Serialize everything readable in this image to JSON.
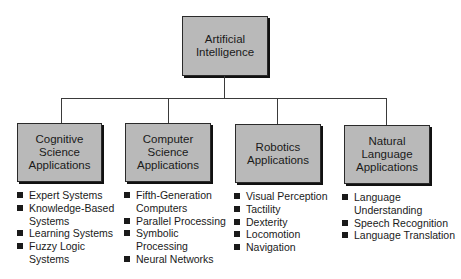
{
  "root": {
    "label": "Artificial\nIntelligence"
  },
  "children": [
    {
      "label": "Cognitive\nScience\nApplications",
      "items": [
        "Expert Systems",
        "Knowledge-Based\nSystems",
        "Learning Systems",
        "Fuzzy Logic\nSystems"
      ]
    },
    {
      "label": "Computer\nScience\nApplications",
      "items": [
        "Fifth-Generation\nComputers",
        "Parallel Processing",
        "Symbolic\nProcessing",
        "Neural Networks"
      ]
    },
    {
      "label": "Robotics\nApplications",
      "items": [
        "Visual Perception",
        "Tactility",
        "Dexterity",
        "Locomotion",
        "Navigation"
      ]
    },
    {
      "label": "Natural\nLanguage\nApplications",
      "items": [
        "Language\nUnderstanding",
        "Speech Recognition",
        "Language Translation"
      ]
    }
  ],
  "colors": {
    "box_fill": "#b9b9b9",
    "line": "#3a3a3a",
    "text": "#1a1a1a"
  }
}
